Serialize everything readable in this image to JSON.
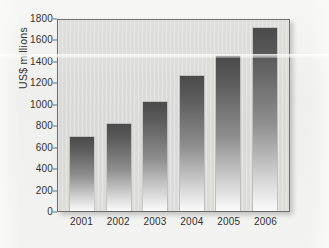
{
  "chart_data": {
    "type": "bar",
    "title": "",
    "xlabel": "",
    "ylabel": "US$ millions",
    "categories": [
      "2001",
      "2002",
      "2003",
      "2004",
      "2005",
      "2006"
    ],
    "values": [
      690,
      815,
      1020,
      1260,
      1450,
      1710
    ],
    "ylim": [
      0,
      1800
    ],
    "ytick_values": [
      0,
      200,
      400,
      600,
      800,
      1000,
      1200,
      1400,
      1600,
      1800
    ],
    "ytick_labels": [
      "0",
      "200",
      "400",
      "600",
      "800",
      "1000",
      "1200",
      "1400",
      "1600",
      "1800"
    ],
    "grid": false,
    "legend": null,
    "series": [
      {
        "name": "US$ millions",
        "values": [
          690,
          815,
          1020,
          1260,
          1450,
          1710
        ]
      }
    ],
    "colors": {
      "bar_top": "#4a4a4a",
      "bar_bottom": "#fbfbfb",
      "plot_background": "#dadad8",
      "axis_line": "#6f6f6f",
      "text": "#2f2f2f",
      "page_background": "#f2f2f0"
    }
  }
}
